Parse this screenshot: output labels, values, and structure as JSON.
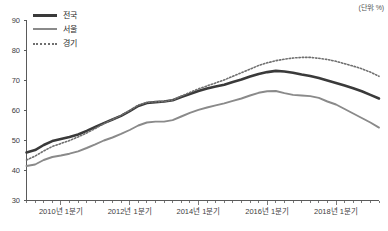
{
  "unit_note": "(단위: %)",
  "legend": {
    "position": "top-left",
    "items": [
      {
        "label": "전국",
        "style": "solid-thick",
        "color": "#3a3a3a",
        "icon": "legend-line-icon"
      },
      {
        "label": "서울",
        "style": "solid-medium",
        "color": "#8a8a8a",
        "icon": "legend-line-icon"
      },
      {
        "label": "경기",
        "style": "dotted",
        "color": "#6f6f6f",
        "icon": "legend-dotted-line-icon"
      }
    ]
  },
  "chart_data": {
    "type": "line",
    "title": "",
    "xlabel": "",
    "ylabel": "",
    "ylim": [
      30,
      90
    ],
    "yticks": [
      30,
      40,
      50,
      60,
      70,
      80,
      90
    ],
    "grid": false,
    "legend_position": "top-left",
    "annotations": [
      "(단위: %)"
    ],
    "x": [
      "2009년 1분기",
      "2009년 2분기",
      "2009년 3분기",
      "2009년 4분기",
      "2010년 1분기",
      "2010년 2분기",
      "2010년 3분기",
      "2010년 4분기",
      "2011년 1분기",
      "2011년 2분기",
      "2011년 3분기",
      "2011년 4분기",
      "2012년 1분기",
      "2012년 2분기",
      "2012년 3분기",
      "2012년 4분기",
      "2013년 1분기",
      "2013년 2분기",
      "2013년 3분기",
      "2013년 4분기",
      "2014년 1분기",
      "2014년 2분기",
      "2014년 3분기",
      "2014년 4분기",
      "2015년 1분기",
      "2015년 2분기",
      "2015년 3분기",
      "2015년 4분기",
      "2016년 1분기",
      "2016년 2분기",
      "2016년 3분기",
      "2016년 4분기",
      "2017년 1분기",
      "2017년 2분기",
      "2017년 3분기",
      "2017년 4분기",
      "2018년 1분기",
      "2018년 2분기",
      "2018년 3분기",
      "2018년 4분기",
      "2019년 1분기",
      "2019년 2분기"
    ],
    "xtick_labels": [
      "2010년 1분기",
      "2012년 1분기",
      "2014년 1분기",
      "2016년 1분기",
      "2018년 1분기"
    ],
    "xtick_indices": [
      4,
      12,
      20,
      28,
      36
    ],
    "series": [
      {
        "name": "전국",
        "color": "#3a3a3a",
        "style": "solid-thick",
        "values": [
          46.0,
          46.8,
          48.5,
          49.8,
          50.5,
          51.2,
          52.0,
          53.2,
          54.5,
          55.8,
          57.0,
          58.2,
          59.8,
          61.5,
          62.5,
          62.8,
          63.0,
          63.4,
          64.5,
          65.5,
          66.5,
          67.3,
          68.0,
          68.6,
          69.5,
          70.3,
          71.3,
          72.2,
          72.8,
          73.2,
          73.0,
          72.6,
          72.0,
          71.5,
          70.8,
          70.0,
          69.2,
          68.3,
          67.4,
          66.4,
          65.2,
          64.0
        ]
      },
      {
        "name": "서울",
        "color": "#8a8a8a",
        "style": "solid-medium",
        "values": [
          41.5,
          42.0,
          43.5,
          44.5,
          45.0,
          45.6,
          46.4,
          47.5,
          48.7,
          50.0,
          51.0,
          52.2,
          53.5,
          55.0,
          56.0,
          56.3,
          56.3,
          56.8,
          58.0,
          59.2,
          60.2,
          61.0,
          61.7,
          62.4,
          63.2,
          64.0,
          65.0,
          65.9,
          66.4,
          66.5,
          65.8,
          65.2,
          65.0,
          64.8,
          64.2,
          63.0,
          62.0,
          60.5,
          59.0,
          57.5,
          56.0,
          54.3
        ]
      },
      {
        "name": "경기",
        "color": "#6f6f6f",
        "style": "dotted",
        "values": [
          43.5,
          44.8,
          46.5,
          48.0,
          49.0,
          50.0,
          51.2,
          52.5,
          54.0,
          55.6,
          57.0,
          58.4,
          60.0,
          61.8,
          62.7,
          62.9,
          63.0,
          63.5,
          64.8,
          66.0,
          67.2,
          68.2,
          69.2,
          70.2,
          71.4,
          72.6,
          73.8,
          75.0,
          75.9,
          76.6,
          77.1,
          77.5,
          77.7,
          77.7,
          77.4,
          77.0,
          76.4,
          75.6,
          74.8,
          73.9,
          72.8,
          71.4
        ]
      }
    ]
  }
}
